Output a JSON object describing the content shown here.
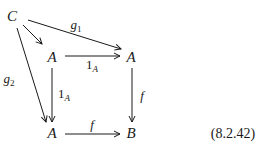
{
  "diagram": {
    "type": "commutative-diagram",
    "nodes": [
      {
        "id": "C",
        "label": "C",
        "x": 12,
        "y": 16
      },
      {
        "id": "A_top_left",
        "label": "A",
        "x": 52,
        "y": 57
      },
      {
        "id": "A_top_right",
        "label": "A",
        "x": 131,
        "y": 57
      },
      {
        "id": "A_bottom_left",
        "label": "A",
        "x": 52,
        "y": 133
      },
      {
        "id": "B",
        "label": "B",
        "x": 131,
        "y": 133
      }
    ],
    "edges": [
      {
        "from": "C",
        "to": "A_top_left",
        "label": ""
      },
      {
        "from": "C",
        "to": "A_top_right",
        "label": "g",
        "label_sub": "1"
      },
      {
        "from": "C",
        "to": "A_bottom_left",
        "label": "g",
        "label_sub": "2"
      },
      {
        "from": "A_top_left",
        "to": "A_top_right",
        "label": "1",
        "label_sub": "A"
      },
      {
        "from": "A_top_left",
        "to": "A_bottom_left",
        "label": "1",
        "label_sub": "A"
      },
      {
        "from": "A_top_right",
        "to": "B",
        "label": "f",
        "label_sub": ""
      },
      {
        "from": "A_bottom_left",
        "to": "B",
        "label": "f",
        "label_sub": ""
      }
    ],
    "equation_number": "(8.2.42)",
    "colors": {
      "ink": "#1a1a1a",
      "background": "#ffffff"
    }
  }
}
